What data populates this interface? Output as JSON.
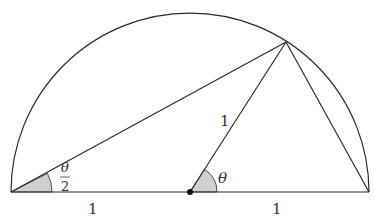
{
  "diagram": {
    "colors": {
      "stroke": "#2b2b2b",
      "angle_fill": "#cfcfcf",
      "text": "#333333"
    },
    "geometry": {
      "center": [
        190,
        192
      ],
      "radius": 179,
      "left_endpoint": [
        11,
        192
      ],
      "right_endpoint": [
        369,
        192
      ],
      "arc_point": [
        286,
        42
      ]
    },
    "labels": {
      "radius_label": "1",
      "left_base_label": "1",
      "right_base_label": "1",
      "central_angle": "θ",
      "inscribed_angle_num": "θ",
      "inscribed_angle_den": "2"
    }
  }
}
